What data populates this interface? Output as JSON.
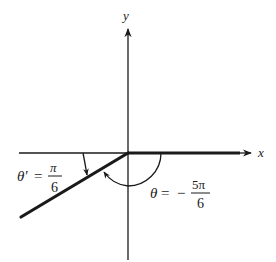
{
  "diagram": {
    "axes": {
      "x_label": "x",
      "y_label": "y"
    },
    "reference_angle": {
      "lhs": "θ′",
      "equals": "=",
      "numerator": "π",
      "denominator": "6"
    },
    "angle": {
      "lhs": "θ",
      "equals": "=",
      "sign": "−",
      "numerator": "5π",
      "denominator": "6"
    },
    "colors": {
      "ink": "#1a1a1a",
      "background": "#ffffff"
    }
  }
}
